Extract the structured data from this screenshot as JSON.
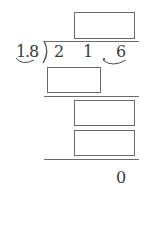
{
  "problem": {
    "type": "long-division",
    "divisor": {
      "digits": [
        "1",
        "8"
      ],
      "display": "1.8",
      "decimal_moved": true
    },
    "dividend": {
      "digits": [
        "2",
        "1",
        "6"
      ],
      "display": "21.6",
      "decimal_moved": true
    },
    "final_remainder": "0",
    "blank_boxes": [
      {
        "id": "quotient",
        "value": ""
      },
      {
        "id": "step1-product",
        "value": ""
      },
      {
        "id": "step2-partial",
        "value": ""
      },
      {
        "id": "step2-product",
        "value": ""
      }
    ]
  },
  "colors": {
    "ink": "#3a3a3a",
    "line": "#6a6a6a",
    "background": "#ffffff"
  }
}
